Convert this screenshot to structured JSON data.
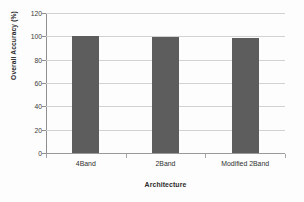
{
  "chart_data": {
    "type": "bar",
    "title": "",
    "subtitle": "",
    "categories": [
      "4Band",
      "2Band",
      "Modified 2Band"
    ],
    "values": [
      100,
      99.5,
      98.5
    ],
    "series": [
      {
        "name": "Overall Accuracy",
        "values": [
          100,
          99.5,
          98.5
        ]
      }
    ],
    "xlabel": "Architecture",
    "ylabel": "Overall Accuracy (%)",
    "ylim": [
      0,
      120
    ],
    "yticks": [
      0,
      20,
      40,
      60,
      80,
      100,
      120
    ],
    "ytick_labels": [
      "0",
      "20",
      "40",
      "60",
      "80",
      "100",
      "120"
    ],
    "grid": true,
    "grid_axis": "y",
    "legend": false,
    "legend_position": "none",
    "bar_color": "#5d5d5d",
    "gridline_color": "#d2d2d2",
    "axis_color": "#8f8f8f",
    "background_color": "#fdfdfd",
    "annotations": []
  }
}
